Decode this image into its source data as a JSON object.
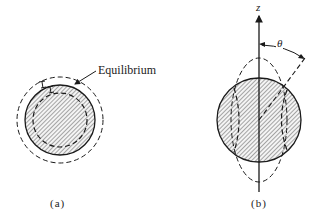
{
  "figure": {
    "panel_a": {
      "caption": "(a)",
      "annotation": "Equilibrium",
      "description": "Sphere (hatched) with outer and inner dashed circles showing radial oscillation about equilibrium"
    },
    "panel_b": {
      "caption": "(b)",
      "axis_label": "z",
      "angle_label": "θ",
      "description": "Hatched sphere with dashed prolate and oblate deformation outlines; angle θ measured from z axis"
    },
    "colors": {
      "line": "#1a1a1a",
      "hatch": "#555555",
      "background": "#ffffff"
    }
  }
}
